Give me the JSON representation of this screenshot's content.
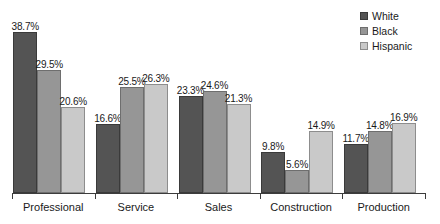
{
  "chart_data": {
    "type": "bar",
    "title": "",
    "subtitle": "",
    "xlabel": "",
    "ylabel": "",
    "ylim": [
      0,
      40
    ],
    "grid": false,
    "legend_position": "top-right",
    "data_labels_suffix": "%",
    "categories": [
      "Professional",
      "Service",
      "Sales",
      "Construction",
      "Production"
    ],
    "series": [
      {
        "name": "White",
        "color": "#545454",
        "values": [
          38.7,
          16.6,
          23.3,
          9.8,
          11.7
        ],
        "labels": [
          "38.7%",
          "16.6%",
          "23.3%",
          "9.8%",
          "11.7%"
        ]
      },
      {
        "name": "Black",
        "color": "#969696",
        "values": [
          29.5,
          25.5,
          24.6,
          5.6,
          14.8
        ],
        "labels": [
          "29.5%",
          "25.5%",
          "24.6%",
          "5.6%",
          "14.8%"
        ]
      },
      {
        "name": "Hispanic",
        "color": "#c9c9c9",
        "values": [
          20.6,
          26.3,
          21.3,
          14.9,
          16.9
        ],
        "labels": [
          "20.6%",
          "26.3%",
          "21.3%",
          "14.9%",
          "16.9%"
        ]
      }
    ]
  },
  "legend": {
    "items": [
      {
        "label": "White",
        "swatch": "legend-swatch-white"
      },
      {
        "label": "Black",
        "swatch": "legend-swatch-black"
      },
      {
        "label": "Hispanic",
        "swatch": "legend-swatch-hispanic"
      }
    ]
  },
  "axis": {
    "categories": [
      "Professional",
      "Service",
      "Sales",
      "Construction",
      "Production"
    ]
  }
}
